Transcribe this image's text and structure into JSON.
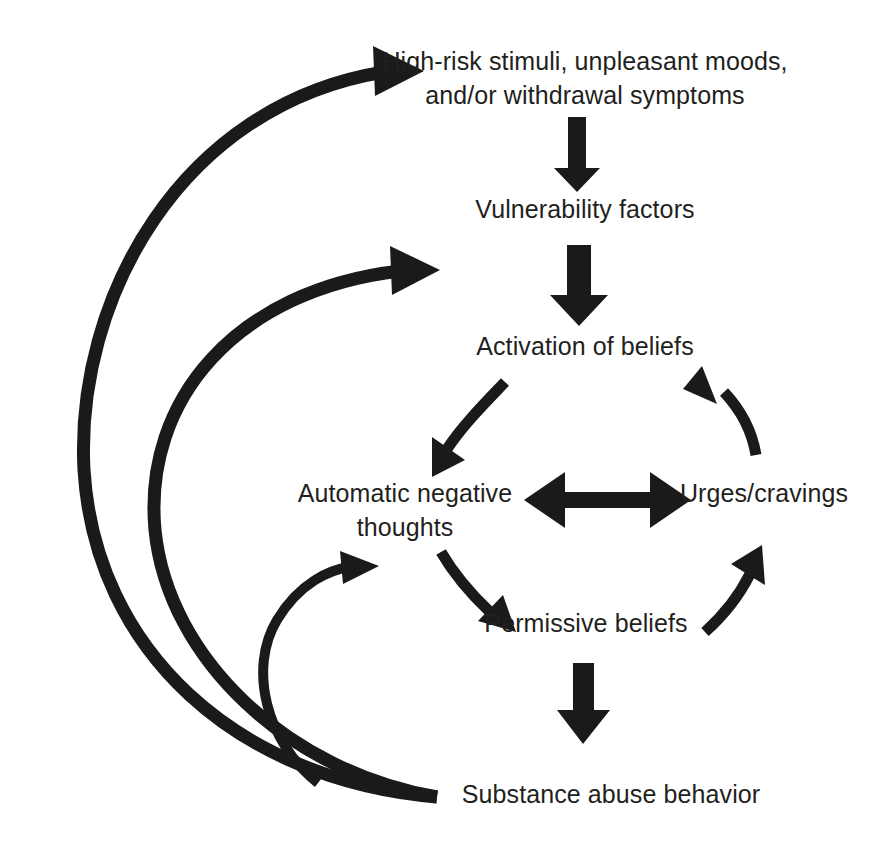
{
  "diagram": {
    "background_color": "#ffffff",
    "ink_color": "#1a1a1a",
    "text_color": "#231f20",
    "nodes": [
      {
        "id": "high-risk-stimuli",
        "lines": [
          "High-risk stimuli, unpleasant moods,",
          "and/or withdrawal symptoms"
        ],
        "line1": "High-risk stimuli, unpleasant moods,",
        "line2": "and/or withdrawal symptoms",
        "x": 585,
        "y": 70
      },
      {
        "id": "vulnerability-factors",
        "line1": "Vulnerability factors",
        "x": 585,
        "y": 218
      },
      {
        "id": "activation-of-beliefs",
        "line1": "Activation of beliefs",
        "x": 585,
        "y": 355
      },
      {
        "id": "automatic-negative-thoughts",
        "line1": "Automatic negative",
        "line2": "thoughts",
        "x": 405,
        "y": 502
      },
      {
        "id": "urges-cravings",
        "line1": "Urges/cravings",
        "x": 764,
        "y": 502
      },
      {
        "id": "permissive-beliefs",
        "line1": "Permissive beliefs",
        "x": 586,
        "y": 632
      },
      {
        "id": "substance-abuse-behavior",
        "line1": "Substance abuse behavior",
        "x": 611,
        "y": 803
      }
    ],
    "edges": [
      {
        "id": "stimuli-to-vulnerability",
        "kind": "straight-arrow-down",
        "from": "high-risk-stimuli",
        "to": "vulnerability-factors"
      },
      {
        "id": "vulnerability-to-activation",
        "kind": "straight-arrow-down",
        "from": "vulnerability-factors",
        "to": "activation-of-beliefs"
      },
      {
        "id": "activation-to-thoughts",
        "kind": "curved-arrow",
        "from": "activation-of-beliefs",
        "to": "automatic-negative-thoughts"
      },
      {
        "id": "thoughts-to-urges",
        "kind": "double-headed-arrow",
        "from": "automatic-negative-thoughts",
        "to": "urges-cravings"
      },
      {
        "id": "thoughts-to-permissive",
        "kind": "curved-arrow",
        "from": "automatic-negative-thoughts",
        "to": "permissive-beliefs"
      },
      {
        "id": "permissive-to-urges",
        "kind": "curved-arrow",
        "from": "permissive-beliefs",
        "to": "urges-cravings"
      },
      {
        "id": "urges-to-activation",
        "kind": "curved-arrow",
        "from": "urges-cravings",
        "to": "activation-of-beliefs"
      },
      {
        "id": "permissive-to-substance-abuse",
        "kind": "straight-arrow-down",
        "from": "permissive-beliefs",
        "to": "substance-abuse-behavior"
      },
      {
        "id": "substance-abuse-to-stimuli",
        "kind": "long-feedback-curve",
        "from": "substance-abuse-behavior",
        "to": "high-risk-stimuli"
      },
      {
        "id": "substance-abuse-to-activation",
        "kind": "long-feedback-curve",
        "from": "substance-abuse-behavior",
        "to": "activation-of-beliefs"
      },
      {
        "id": "substance-abuse-to-thoughts",
        "kind": "short-feedback-curve",
        "from": "substance-abuse-behavior",
        "to": "automatic-negative-thoughts"
      }
    ]
  }
}
